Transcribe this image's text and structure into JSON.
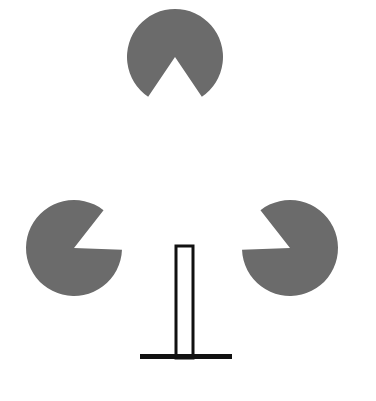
{
  "scene": {
    "title": "Kanizsa illusory triangle with inverted-T bar figure",
    "width": 376,
    "height": 401,
    "background_color": "#ffffff",
    "inducer_color": "#6b6b6b",
    "line_color": "#111111"
  },
  "inducers": [
    {
      "name": "top-pacman",
      "label": "Top pac-man inducer",
      "cx": 175,
      "cy": 57,
      "r": 48,
      "wedge_start_deg": 56,
      "wedge_end_deg": 124,
      "opening_direction": "down"
    },
    {
      "name": "bottom-left-pacman",
      "label": "Bottom-left pac-man inducer",
      "cx": 74,
      "cy": 248,
      "r": 48,
      "wedge_start_deg": -52,
      "wedge_end_deg": 2,
      "opening_direction": "upper-right"
    },
    {
      "name": "bottom-right-pacman",
      "label": "Bottom-right pac-man inducer",
      "cx": 290,
      "cy": 248,
      "r": 48,
      "wedge_start_deg": 178,
      "wedge_end_deg": 232,
      "opening_direction": "upper-left"
    }
  ],
  "bar_figure": {
    "name": "inverted-t-bar",
    "label": "Inverted T bar figure",
    "post": {
      "x": 176,
      "y": 246,
      "width": 17,
      "height": 112,
      "stroke_width": 3,
      "fill": "#ffffff"
    },
    "base": {
      "x": 140,
      "y": 354,
      "width": 92,
      "height": 5
    }
  },
  "geometry_notes": {
    "illusory_shape": "triangle",
    "vertex_count": 3
  }
}
